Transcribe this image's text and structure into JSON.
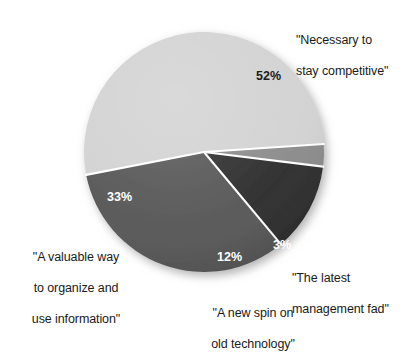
{
  "chart_data": {
    "type": "pie",
    "title": "",
    "subtitle": "",
    "xlabel": "",
    "ylabel": "",
    "legend_position": "none",
    "grid": false,
    "value_unit": "%",
    "categories": [
      "\"Necessary to stay competitive\"",
      "\"A valuable way to organize and use information\"",
      "\"A new spin on old technology\"",
      "\"The latest management fad\""
    ],
    "values": [
      52,
      33,
      12,
      3
    ],
    "value_labels": [
      "52%",
      "33%",
      "12%",
      "3%"
    ],
    "colors": [
      "#d2d2d2",
      "#565656",
      "#2d2d2d",
      "#8b8b8b"
    ],
    "slices": [
      {
        "name": "necessary-to-stay-competitive",
        "value": 52,
        "value_label": "52%",
        "color": "#d2d2d2",
        "label_color": "#1c1c1c",
        "external_label_lines": [
          "\"Necessary to",
          "stay competitive\""
        ]
      },
      {
        "name": "valuable-way-to-organize",
        "value": 33,
        "value_label": "33%",
        "color": "#565656",
        "label_color": "#ffffff",
        "external_label_lines": [
          "\"A valuable way",
          "to organize and",
          "use information\""
        ]
      },
      {
        "name": "new-spin-on-old-technology",
        "value": 12,
        "value_label": "12%",
        "color": "#2d2d2d",
        "label_color": "#ffffff",
        "external_label_lines": [
          "\"A new spin on",
          "old technology\""
        ]
      },
      {
        "name": "latest-management-fad",
        "value": 3,
        "value_label": "3%",
        "color": "#8b8b8b",
        "label_color": "#ffffff",
        "external_label_lines": [
          "\"The latest",
          "management fad\""
        ]
      }
    ],
    "separator_color": "#ffffff",
    "background_color": "#ffffff"
  },
  "labels": {
    "necessary": {
      "line1": "\"Necessary to",
      "line2": "stay competitive\""
    },
    "valuable": {
      "line1": "\"A valuable way",
      "line2": "to organize and",
      "line3": "use information\""
    },
    "newspin": {
      "line1": "\"A new spin on",
      "line2": "old technology\""
    },
    "fad": {
      "line1": "\"The latest",
      "line2": "management fad\""
    }
  },
  "percentages": {
    "p52": "52%",
    "p33": "33%",
    "p12": "12%",
    "p3": "3%"
  }
}
